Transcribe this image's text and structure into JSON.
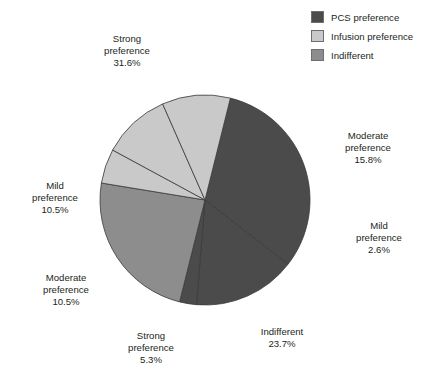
{
  "legend": {
    "items": [
      {
        "label": "PCS preference",
        "color": "#4b4b4b",
        "icon": "color-swatch-icon"
      },
      {
        "label": "Infusion preference",
        "color": "#c9c9c9",
        "icon": "color-swatch-icon"
      },
      {
        "label": "Indifferent",
        "color": "#8d8d8d",
        "icon": "color-swatch-icon"
      }
    ]
  },
  "callouts": {
    "strong_pcs": {
      "line1": "Strong",
      "line2": "preference",
      "line3": "31.6%"
    },
    "moderate_pcs": {
      "line1": "Moderate",
      "line2": "preference",
      "line3": "15.8%"
    },
    "mild_pcs": {
      "line1": "Mild",
      "line2": "preference",
      "line3": "2.6%"
    },
    "indifferent": {
      "line1": "Indifferent",
      "line2": "23.7%",
      "line3": ""
    },
    "strong_inf": {
      "line1": "Strong",
      "line2": "preference",
      "line3": "5.3%"
    },
    "moderate_inf": {
      "line1": "Moderate",
      "line2": "preference",
      "line3": "10.5%"
    },
    "mild_inf": {
      "line1": "Mild",
      "line2": "preference",
      "line3": "10.5%"
    }
  },
  "chart_data": {
    "type": "pie",
    "title": "",
    "legend_position": "top-right",
    "grid": false,
    "center_px": [
      205,
      200
    ],
    "radius_px": 105,
    "start_angle_deg": -76,
    "direction": "clockwise",
    "total": 100.0,
    "units": "percent",
    "categories": [
      "Strong preference (PCS)",
      "Moderate preference (PCS)",
      "Mild preference (PCS)",
      "Indifferent",
      "Strong preference (Infusion)",
      "Moderate preference (Infusion)",
      "Mild preference (Infusion)"
    ],
    "values": [
      31.6,
      15.8,
      2.6,
      23.7,
      5.3,
      10.5,
      10.5
    ],
    "slices": [
      {
        "label": "Strong preference",
        "group": "PCS preference",
        "value": 31.6,
        "display": "31.6%",
        "color": "#4b4b4b"
      },
      {
        "label": "Moderate preference",
        "group": "PCS preference",
        "value": 15.8,
        "display": "15.8%",
        "color": "#4b4b4b"
      },
      {
        "label": "Mild preference",
        "group": "PCS preference",
        "value": 2.6,
        "display": "2.6%",
        "color": "#4b4b4b"
      },
      {
        "label": "Indifferent",
        "group": "Indifferent",
        "value": 23.7,
        "display": "23.7%",
        "color": "#8d8d8d"
      },
      {
        "label": "Strong preference",
        "group": "Infusion preference",
        "value": 5.3,
        "display": "5.3%",
        "color": "#c9c9c9"
      },
      {
        "label": "Moderate preference",
        "group": "Infusion preference",
        "value": 10.5,
        "display": "10.5%",
        "color": "#c9c9c9"
      },
      {
        "label": "Mild preference",
        "group": "Infusion preference",
        "value": 10.5,
        "display": "10.5%",
        "color": "#c9c9c9"
      }
    ],
    "group_totals": [
      {
        "group": "PCS preference",
        "value": 50.0
      },
      {
        "group": "Indifferent",
        "value": 23.7
      },
      {
        "group": "Infusion preference",
        "value": 26.3
      }
    ]
  },
  "style": {
    "slice_stroke": "#3a3a3a",
    "background": "#ffffff",
    "text_color": "#231f20"
  }
}
